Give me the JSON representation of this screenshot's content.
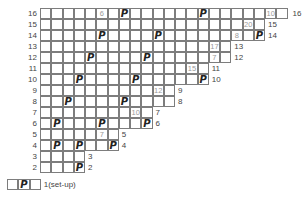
{
  "chart_data": {
    "type": "table",
    "title": "",
    "symbol": "P",
    "rows": [
      {
        "row": 16,
        "label": "16",
        "cells": 22,
        "symbols": [
          7,
          14
        ],
        "count": {
          "col": 5,
          "text": "6"
        },
        "count2": {
          "col": 20,
          "text": "10"
        }
      },
      {
        "row": 15,
        "label": "15",
        "cells": 20,
        "symbols": [],
        "count": {
          "col": 18,
          "text": "20"
        }
      },
      {
        "row": 14,
        "label": "14",
        "cells": 20,
        "symbols": [
          5,
          10,
          19
        ],
        "count": {
          "col": 17,
          "text": "8"
        }
      },
      {
        "row": 13,
        "label": "13",
        "cells": 17,
        "symbols": [],
        "count": {
          "col": 15,
          "text": "17"
        }
      },
      {
        "row": 12,
        "label": "12",
        "cells": 17,
        "symbols": [
          4,
          9
        ],
        "count": {
          "col": 15,
          "text": "7"
        }
      },
      {
        "row": 11,
        "label": "11",
        "cells": 15,
        "symbols": [],
        "count": {
          "col": 13,
          "text": "15"
        }
      },
      {
        "row": 10,
        "label": "10",
        "cells": 15,
        "symbols": [
          3,
          8,
          14
        ],
        "count": null
      },
      {
        "row": 9,
        "label": "9",
        "cells": 12,
        "symbols": [],
        "count": {
          "col": 10,
          "text": "12"
        }
      },
      {
        "row": 8,
        "label": "8",
        "cells": 12,
        "symbols": [
          2,
          7
        ],
        "count": null
      },
      {
        "row": 7,
        "label": "7",
        "cells": 10,
        "symbols": [],
        "count": {
          "col": 8,
          "text": "10"
        }
      },
      {
        "row": 6,
        "label": "6",
        "cells": 10,
        "symbols": [
          1,
          5,
          9
        ],
        "count": null
      },
      {
        "row": 5,
        "label": "5",
        "cells": 7,
        "symbols": [],
        "count": {
          "col": 5,
          "text": "7"
        }
      },
      {
        "row": 4,
        "label": "4",
        "cells": 7,
        "symbols": [
          1,
          3,
          6
        ],
        "count": null
      },
      {
        "row": 3,
        "label": "3",
        "cells": 4,
        "symbols": [],
        "count": null
      },
      {
        "row": 2,
        "label": "2",
        "cells": 4,
        "symbols": [
          3
        ],
        "count": null
      },
      {
        "row": 1,
        "label": "1(set-up)",
        "cells": 3,
        "symbols": [
          1
        ],
        "count": null,
        "offset_left": true
      }
    ]
  }
}
